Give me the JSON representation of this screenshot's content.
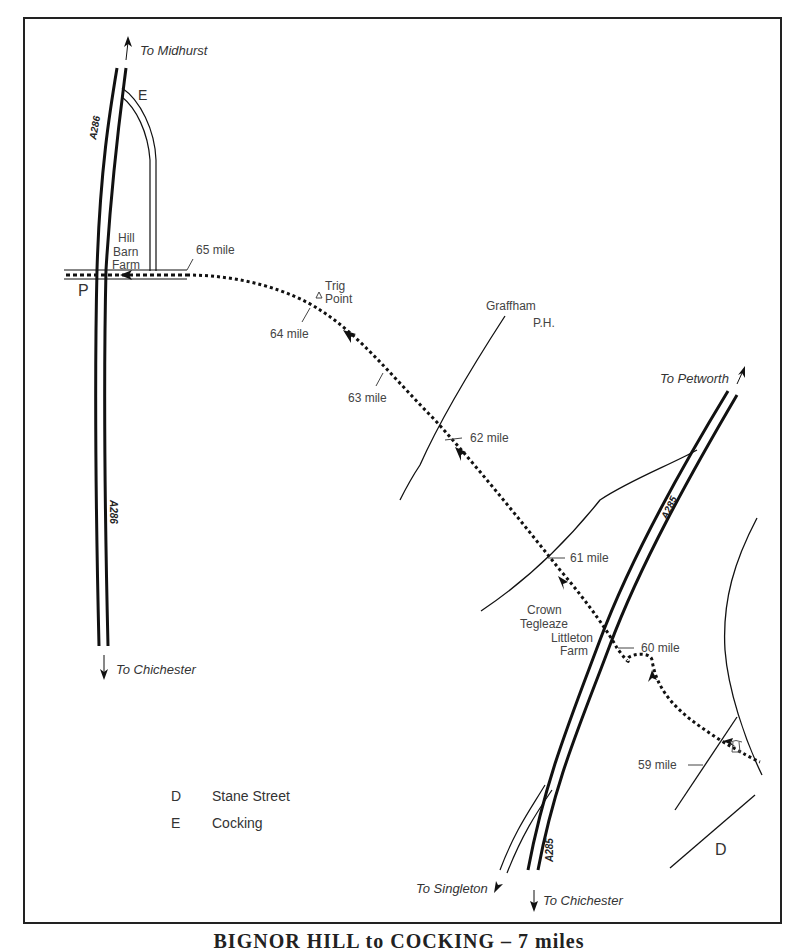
{
  "map": {
    "title": "BIGNOR HILL to COCKING – 7 miles",
    "directions": {
      "to_midhurst": "To Midhurst",
      "to_chichester_west": "To Chichester",
      "to_petworth": "To Petworth",
      "to_singleton": "To Singleton",
      "to_chichester_south": "To Chichester"
    },
    "roads": {
      "a286_top": "A286",
      "a286_bottom": "A286",
      "a285_mid": "A285",
      "a285_bottom": "A285"
    },
    "places": {
      "hill_barn_farm": [
        "Hill",
        "Barn",
        "Farm"
      ],
      "trig_point": [
        "Trig",
        "Point"
      ],
      "graffham": "Graffham",
      "ph": "P.H.",
      "crown_tegleaze": [
        "Crown",
        "Tegleaze"
      ],
      "littleton_farm": [
        "Littleton",
        "Farm"
      ]
    },
    "markers": {
      "e": "E",
      "p": "P",
      "d": "D"
    },
    "mileposts": [
      "65 mile",
      "64 mile",
      "63 mile",
      "62 mile",
      "61 mile",
      "60 mile",
      "59 mile"
    ],
    "legend": [
      {
        "key": "D",
        "label": "Stane Street"
      },
      {
        "key": "E",
        "label": "Cocking"
      }
    ],
    "colors": {
      "ink": "#111111",
      "text": "#444444",
      "background": "#ffffff"
    }
  }
}
